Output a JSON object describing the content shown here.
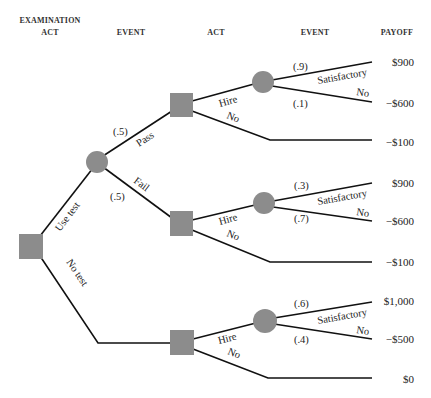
{
  "headers": {
    "examination_act_line1": "EXAMINATION",
    "examination_act_line2": "ACT",
    "event1": "EVENT",
    "act": "ACT",
    "event2": "EVENT",
    "payoff": "PAYOFF"
  },
  "colors": {
    "node_fill": "#8c8c8c",
    "edge": "#111111"
  },
  "tree": {
    "root": {
      "type": "decision",
      "branches": {
        "use_test": "Use test",
        "no_test": "No test"
      }
    },
    "test_event": {
      "type": "chance",
      "pass": {
        "label": "Pass",
        "prob": "(.5)"
      },
      "fail": {
        "label": "Fail",
        "prob": "(.5)"
      }
    },
    "pass_act": {
      "type": "decision",
      "hire": "Hire",
      "no": "No",
      "event": {
        "satisfactory": {
          "label": "Satisfactory",
          "prob": "(.9)",
          "payoff": "$900"
        },
        "no": {
          "label": "No",
          "prob": "(.1)",
          "payoff": "−$600"
        }
      },
      "no_payoff": "−$100"
    },
    "fail_act": {
      "type": "decision",
      "hire": "Hire",
      "no": "No",
      "event": {
        "satisfactory": {
          "label": "Satisfactory",
          "prob": "(.3)",
          "payoff": "$900"
        },
        "no": {
          "label": "No",
          "prob": "(.7)",
          "payoff": "−$600"
        }
      },
      "no_payoff": "−$100"
    },
    "notest_act": {
      "type": "decision",
      "hire": "Hire",
      "no": "No",
      "event": {
        "satisfactory": {
          "label": "Satisfactory",
          "prob": "(.6)",
          "payoff": "$1,000"
        },
        "no": {
          "label": "No",
          "prob": "(.4)",
          "payoff": "−$500"
        }
      },
      "no_payoff": "$0"
    }
  }
}
